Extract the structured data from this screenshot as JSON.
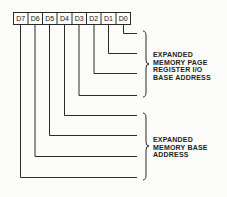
{
  "register": {
    "bits": [
      "D7",
      "D6",
      "D5",
      "D4",
      "D3",
      "D2",
      "D1",
      "D0"
    ]
  },
  "groups": [
    {
      "lines": [
        "EXPANDED",
        "MEMORY PAGE",
        "REGISTER I/O",
        "BASE ADDRESS"
      ],
      "bits": [
        "D0",
        "D1",
        "D2",
        "D3"
      ]
    },
    {
      "lines": [
        "EXPANDED",
        "MEMORY BASE",
        "ADDRESS"
      ],
      "bits": [
        "D4",
        "D5",
        "D6",
        "D7"
      ]
    }
  ],
  "colors": {
    "line": "#2a2a2a",
    "background": "#fbfbfa"
  }
}
